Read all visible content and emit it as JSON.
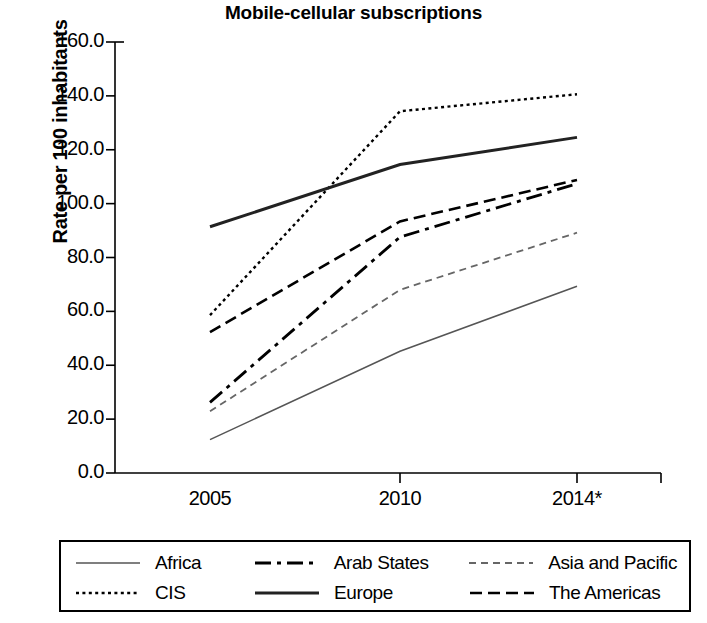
{
  "chart_data": {
    "type": "line",
    "title": "Mobile-cellular subscriptions",
    "xlabel": "",
    "ylabel": "Rate per 100 inhabitants",
    "categories": [
      "2005",
      "2010",
      "2014*"
    ],
    "x": [
      "2005",
      "2010",
      "2014*"
    ],
    "ylim": [
      0.0,
      160.0
    ],
    "ytick_labels": [
      "160.0",
      "140.0",
      "120.0",
      "100.0",
      "80.0",
      "60.0",
      "40.0",
      "20.0",
      "0.0"
    ],
    "ytick_values": [
      160.0,
      140.0,
      120.0,
      100.0,
      80.0,
      60.0,
      40.0,
      20.0,
      0.0
    ],
    "xtick_labels": [
      "2005",
      "2010",
      "2014*"
    ],
    "grid": false,
    "legend_position": "bottom",
    "legend_columns": 3,
    "series": [
      {
        "name": "Africa",
        "values": [
          12.4,
          45.2,
          69.3
        ],
        "style": "solid-thin",
        "color": "#555555"
      },
      {
        "name": "Arab States",
        "values": [
          26.2,
          87.6,
          107.4
        ],
        "style": "dash-dot",
        "color": "#000000"
      },
      {
        "name": "Asia and Pacific",
        "values": [
          22.9,
          68.0,
          89.2
        ],
        "style": "fine-dash",
        "color": "#666666"
      },
      {
        "name": "CIS",
        "values": [
          58.6,
          134.3,
          140.6
        ],
        "style": "dotted",
        "color": "#000000"
      },
      {
        "name": "Europe",
        "values": [
          91.4,
          114.5,
          124.6
        ],
        "style": "solid-thick",
        "color": "#222222"
      },
      {
        "name": "The Americas",
        "values": [
          52.3,
          93.4,
          108.8
        ],
        "style": "dashed",
        "color": "#000000"
      }
    ]
  },
  "legend": {
    "rows": [
      [
        {
          "label": "Africa",
          "style": "solid-thin"
        },
        {
          "label": "Arab States",
          "style": "dash-dot"
        },
        {
          "label": "Asia and Pacific",
          "style": "fine-dash"
        }
      ],
      [
        {
          "label": "CIS",
          "style": "dotted"
        },
        {
          "label": "Europe",
          "style": "solid-thick"
        },
        {
          "label": "The Americas",
          "style": "dashed"
        }
      ]
    ]
  }
}
